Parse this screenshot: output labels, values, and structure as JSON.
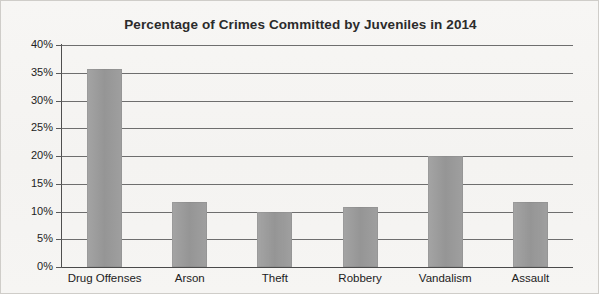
{
  "chart_data": {
    "type": "bar",
    "title": "Percentage of Crimes Committed by Juveniles in 2014",
    "xlabel": "",
    "ylabel": "",
    "categories": [
      "Drug Offenses",
      "Arson",
      "Theft",
      "Robbery",
      "Vandalism",
      "Assault"
    ],
    "values": [
      35.6,
      11.7,
      10.0,
      10.8,
      20.0,
      11.8
    ],
    "ylim": [
      0,
      40
    ],
    "ytick_labels": [
      "40%",
      "35%",
      "30%",
      "25%",
      "20%",
      "15%",
      "10%",
      "5%",
      "0%"
    ],
    "ytick_values": [
      40,
      35,
      30,
      25,
      20,
      15,
      10,
      5,
      0
    ],
    "grid": true,
    "legend": null,
    "bar_color": "#9a9a9a",
    "background_color": "#f6f5f3",
    "axis_color": "#4f4f4f",
    "text_color": "#222222"
  }
}
